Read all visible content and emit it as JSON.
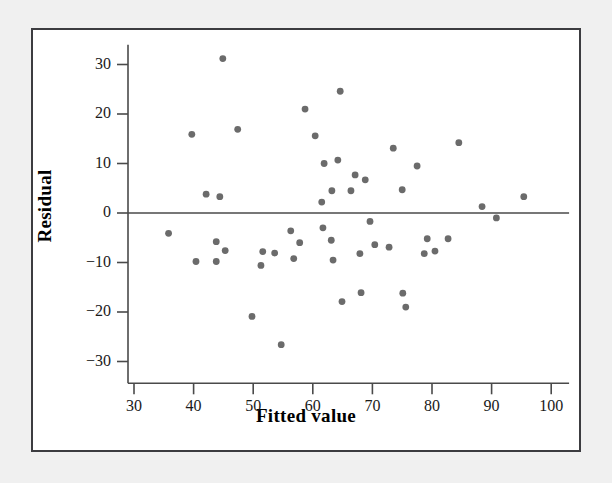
{
  "figure": {
    "background_color": "#f0f0f0",
    "panel_color": "#ffffff",
    "frame_color": "#3c3c40",
    "point_color": "#6b6b6b",
    "axis_color": "#4a4a4a"
  },
  "chart_data": {
    "type": "scatter",
    "title": "",
    "subtitle": "",
    "xlabel": "Fitted value",
    "ylabel": "Residual",
    "xlim": [
      27,
      103
    ],
    "ylim": [
      -34,
      34
    ],
    "xticks": [
      30,
      40,
      50,
      60,
      70,
      80,
      90,
      100
    ],
    "yticks": [
      30,
      20,
      10,
      0,
      -10,
      -20,
      -30
    ],
    "xticklabels": [
      "30",
      "40",
      "50",
      "60",
      "70",
      "80",
      "90",
      "100"
    ],
    "yticklabels": [
      "30",
      "20",
      "10",
      "0",
      "−10",
      "−20",
      "−30"
    ],
    "grid": false,
    "legend": null,
    "annotations": [
      {
        "type": "hline",
        "y": 0,
        "label": "zero-residual-reference-line"
      }
    ],
    "series": [
      {
        "name": "residuals",
        "marker": "circle",
        "color": "#6b6b6b",
        "points": [
          [
            35.8,
            -4.1
          ],
          [
            39.7,
            15.9
          ],
          [
            40.4,
            -9.8
          ],
          [
            42.1,
            3.8
          ],
          [
            43.8,
            -5.8
          ],
          [
            43.8,
            -9.8
          ],
          [
            44.4,
            3.3
          ],
          [
            44.9,
            31.2
          ],
          [
            45.3,
            -7.6
          ],
          [
            47.4,
            16.9
          ],
          [
            49.8,
            -20.9
          ],
          [
            51.3,
            -10.6
          ],
          [
            51.6,
            -7.8
          ],
          [
            53.6,
            -8.1
          ],
          [
            54.7,
            -26.6
          ],
          [
            56.3,
            -3.6
          ],
          [
            56.8,
            -9.2
          ],
          [
            57.8,
            -6.0
          ],
          [
            58.7,
            21.0
          ],
          [
            60.4,
            15.6
          ],
          [
            61.5,
            2.2
          ],
          [
            61.7,
            -3.0
          ],
          [
            61.9,
            10.0
          ],
          [
            63.1,
            -5.5
          ],
          [
            63.2,
            4.5
          ],
          [
            63.4,
            -9.5
          ],
          [
            64.2,
            10.7
          ],
          [
            64.6,
            24.6
          ],
          [
            64.9,
            -17.9
          ],
          [
            66.4,
            4.5
          ],
          [
            67.1,
            7.7
          ],
          [
            67.9,
            -8.2
          ],
          [
            68.1,
            -16.1
          ],
          [
            68.8,
            6.7
          ],
          [
            69.6,
            -1.7
          ],
          [
            70.4,
            -6.4
          ],
          [
            72.8,
            -6.9
          ],
          [
            73.5,
            13.1
          ],
          [
            75.0,
            4.7
          ],
          [
            75.1,
            -16.2
          ],
          [
            75.6,
            -19.0
          ],
          [
            77.5,
            9.5
          ],
          [
            78.7,
            -8.2
          ],
          [
            79.2,
            -5.2
          ],
          [
            80.5,
            -7.7
          ],
          [
            82.7,
            -5.2
          ],
          [
            84.5,
            14.2
          ],
          [
            88.4,
            1.3
          ],
          [
            90.8,
            -1.0
          ],
          [
            95.4,
            3.3
          ]
        ]
      }
    ]
  }
}
